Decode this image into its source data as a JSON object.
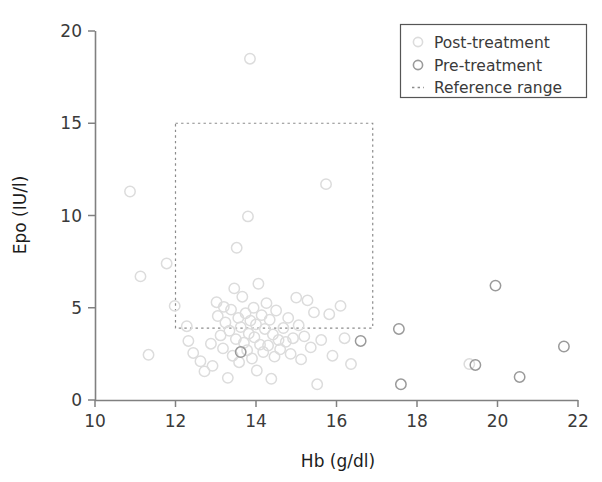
{
  "chart_data": {
    "type": "scatter",
    "title": "",
    "xlabel": "Hb (g/dl)",
    "ylabel": "Epo (IU/l)",
    "xlim": [
      10,
      22
    ],
    "ylim": [
      0,
      20
    ],
    "xticks": [
      10,
      12,
      14,
      16,
      18,
      20,
      22
    ],
    "yticks": [
      0,
      5,
      10,
      15,
      20
    ],
    "grid": false,
    "legend_position": "top-right",
    "colors": {
      "post_treatment": "#dcdcdc",
      "pre_treatment": "#9a9a9a",
      "reference_range": "#8c8c8c",
      "axis": "#808080",
      "text": "#3a3a3a"
    },
    "annotations": {
      "reference_range": {
        "label": "Reference range",
        "hb_min": 12.0,
        "hb_max": 16.9,
        "epo_min": 3.9,
        "epo_max": 15.0,
        "style": "dotted rectangle"
      }
    },
    "series": [
      {
        "name": "Post-treatment",
        "marker": "open-circle",
        "color": "#dcdcdc",
        "points": [
          [
            10.87,
            11.3
          ],
          [
            11.13,
            6.7
          ],
          [
            11.33,
            2.45
          ],
          [
            11.78,
            7.4
          ],
          [
            11.98,
            5.1
          ],
          [
            12.28,
            4.0
          ],
          [
            12.32,
            3.2
          ],
          [
            12.44,
            2.55
          ],
          [
            12.62,
            2.1
          ],
          [
            12.72,
            1.55
          ],
          [
            12.88,
            3.05
          ],
          [
            12.92,
            1.85
          ],
          [
            13.02,
            5.3
          ],
          [
            13.05,
            4.55
          ],
          [
            13.12,
            3.5
          ],
          [
            13.18,
            2.8
          ],
          [
            13.2,
            5.05
          ],
          [
            13.24,
            4.2
          ],
          [
            13.3,
            1.2
          ],
          [
            13.34,
            3.75
          ],
          [
            13.38,
            4.9
          ],
          [
            13.42,
            2.4
          ],
          [
            13.46,
            6.05
          ],
          [
            13.5,
            3.3
          ],
          [
            13.52,
            8.25
          ],
          [
            13.56,
            4.45
          ],
          [
            13.58,
            2.05
          ],
          [
            13.62,
            3.95
          ],
          [
            13.66,
            5.6
          ],
          [
            13.7,
            3.1
          ],
          [
            13.74,
            4.7
          ],
          [
            13.78,
            2.7
          ],
          [
            13.8,
            9.95
          ],
          [
            13.82,
            3.6
          ],
          [
            13.85,
            18.5
          ],
          [
            13.86,
            4.3
          ],
          [
            13.9,
            2.25
          ],
          [
            13.94,
            5.0
          ],
          [
            13.96,
            3.4
          ],
          [
            14.0,
            4.1
          ],
          [
            14.02,
            1.6
          ],
          [
            14.06,
            6.3
          ],
          [
            14.1,
            3.0
          ],
          [
            14.14,
            4.6
          ],
          [
            14.18,
            2.6
          ],
          [
            14.22,
            3.85
          ],
          [
            14.26,
            5.25
          ],
          [
            14.3,
            2.95
          ],
          [
            14.34,
            4.35
          ],
          [
            14.38,
            1.15
          ],
          [
            14.42,
            3.55
          ],
          [
            14.46,
            2.35
          ],
          [
            14.5,
            4.85
          ],
          [
            14.56,
            3.25
          ],
          [
            14.6,
            2.75
          ],
          [
            14.68,
            3.9
          ],
          [
            14.74,
            3.15
          ],
          [
            14.8,
            4.45
          ],
          [
            14.86,
            2.5
          ],
          [
            14.92,
            3.35
          ],
          [
            15.0,
            5.55
          ],
          [
            15.06,
            4.05
          ],
          [
            15.12,
            2.2
          ],
          [
            15.2,
            3.45
          ],
          [
            15.28,
            5.4
          ],
          [
            15.36,
            2.85
          ],
          [
            15.44,
            4.75
          ],
          [
            15.52,
            0.85
          ],
          [
            15.62,
            3.25
          ],
          [
            15.74,
            11.7
          ],
          [
            15.82,
            4.65
          ],
          [
            15.9,
            2.4
          ],
          [
            16.1,
            5.1
          ],
          [
            16.2,
            3.35
          ],
          [
            16.36,
            1.95
          ],
          [
            19.3,
            1.95
          ]
        ]
      },
      {
        "name": "Pre-treatment",
        "marker": "open-circle",
        "color": "#9a9a9a",
        "points": [
          [
            13.62,
            2.6
          ],
          [
            16.6,
            3.2
          ],
          [
            17.55,
            3.85
          ],
          [
            17.6,
            0.85
          ],
          [
            19.45,
            1.9
          ],
          [
            19.95,
            6.2
          ],
          [
            20.55,
            1.25
          ],
          [
            21.65,
            2.9
          ]
        ]
      }
    ]
  },
  "legend": {
    "entries": [
      {
        "label": "Post-treatment",
        "marker": "open-circle",
        "color": "#dcdcdc"
      },
      {
        "label": "Pre-treatment",
        "marker": "open-circle",
        "color": "#9a9a9a"
      },
      {
        "label": "Reference range",
        "marker": "dashed-line",
        "color": "#8c8c8c"
      }
    ]
  },
  "axes": {
    "x_title": "Hb (g/dl)",
    "y_title": "Epo (IU/l)",
    "x_tick_labels": [
      "10",
      "12",
      "14",
      "16",
      "18",
      "20",
      "22"
    ],
    "y_tick_labels": [
      "0",
      "5",
      "10",
      "15",
      "20"
    ]
  }
}
